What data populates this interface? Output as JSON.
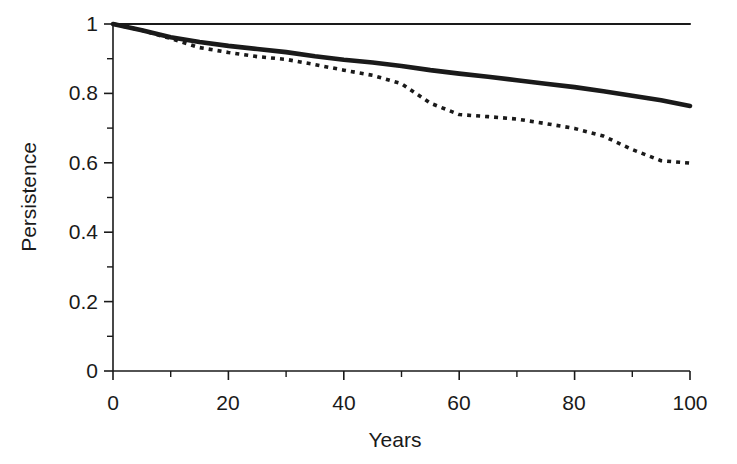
{
  "chart_data": {
    "type": "line",
    "title": "",
    "xlabel": "Years",
    "ylabel": "Persistence",
    "xlim": [
      0,
      100
    ],
    "ylim": [
      0,
      1
    ],
    "grid": false,
    "legend": "none",
    "x_ticks": [
      0,
      20,
      40,
      60,
      80,
      100
    ],
    "x_tick_labels": [
      "0",
      "20",
      "40",
      "60",
      "80",
      "100"
    ],
    "x_minor_ticks": [
      10,
      30,
      50,
      70,
      90
    ],
    "y_ticks": [
      0,
      0.2,
      0.4,
      0.6,
      0.8,
      1
    ],
    "y_tick_labels": [
      "0",
      "0.2",
      "0.4",
      "0.6",
      "0.8",
      "1"
    ],
    "y_minor_ticks": [
      0.1,
      0.3,
      0.5,
      0.7,
      0.9
    ],
    "x": [
      0,
      5,
      10,
      15,
      20,
      25,
      30,
      35,
      40,
      45,
      50,
      55,
      60,
      65,
      70,
      75,
      80,
      85,
      90,
      95,
      100
    ],
    "series": [
      {
        "name": "reference",
        "style": "thin-solid",
        "values": [
          1,
          1,
          1,
          1,
          1,
          1,
          1,
          1,
          1,
          1,
          1,
          1,
          1,
          1,
          1,
          1,
          1,
          1,
          1,
          1,
          1
        ]
      },
      {
        "name": "upper-curve",
        "style": "thick-solid",
        "values": [
          1,
          0.982,
          0.962,
          0.948,
          0.937,
          0.928,
          0.919,
          0.907,
          0.897,
          0.889,
          0.879,
          0.867,
          0.857,
          0.848,
          0.838,
          0.828,
          0.818,
          0.806,
          0.793,
          0.78,
          0.764
        ]
      },
      {
        "name": "lower-curve",
        "style": "dotted",
        "values": [
          1,
          0.982,
          0.958,
          0.932,
          0.918,
          0.906,
          0.898,
          0.883,
          0.867,
          0.852,
          0.828,
          0.772,
          0.739,
          0.733,
          0.726,
          0.713,
          0.699,
          0.677,
          0.638,
          0.606,
          0.599
        ]
      }
    ]
  },
  "axes": {
    "y_title": "Persistence",
    "x_title": "Years"
  }
}
